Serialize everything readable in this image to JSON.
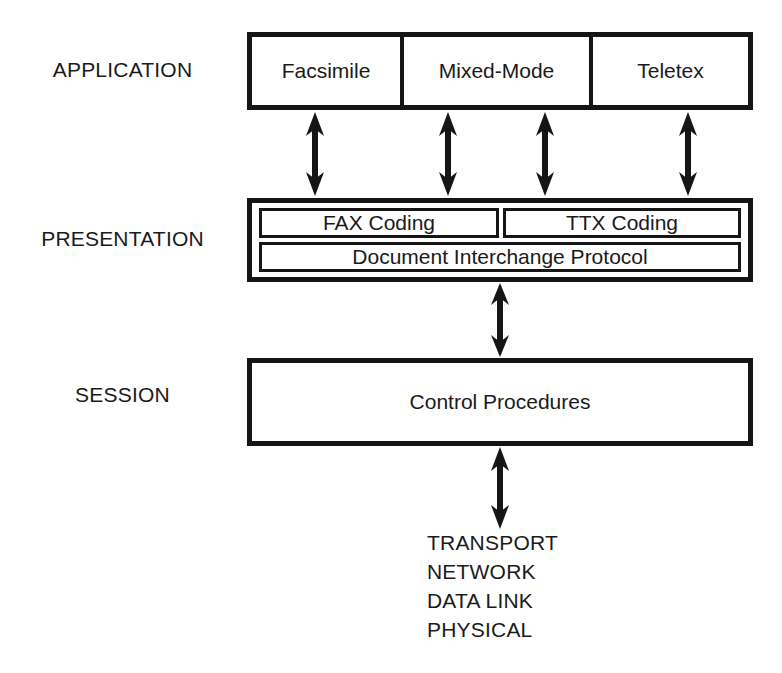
{
  "diagram": {
    "stroke_color": "#151515",
    "text_color": "#1a1a1a",
    "background": "#ffffff",
    "layer_labels": {
      "application": "APPLICATION",
      "presentation": "PRESENTATION",
      "session": "SESSION"
    },
    "application_layer": {
      "boxes": [
        {
          "label": "Facsimile"
        },
        {
          "label": "Mixed-Mode"
        },
        {
          "label": "Teletex"
        }
      ]
    },
    "presentation_layer": {
      "coding_boxes": [
        {
          "label": "FAX Coding"
        },
        {
          "label": "TTX Coding"
        }
      ],
      "protocol_box": {
        "label": "Document Interchange Protocol"
      }
    },
    "session_layer": {
      "box": {
        "label": "Control Procedures"
      }
    },
    "lower_layers": [
      "TRANSPORT",
      "NETWORK",
      "DATA LINK",
      "PHYSICAL"
    ],
    "connectors": {
      "application_to_presentation": {
        "icon": "double-headed-vertical-arrow",
        "count": 4
      },
      "presentation_to_session": {
        "icon": "double-headed-vertical-arrow",
        "count": 1
      },
      "session_to_transport": {
        "icon": "double-headed-vertical-arrow",
        "count": 1
      }
    }
  }
}
